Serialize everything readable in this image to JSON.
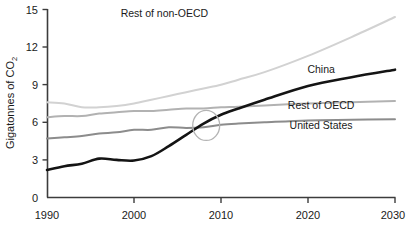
{
  "chart_data": {
    "type": "line",
    "title": "",
    "subtitle": "",
    "xlabel": "",
    "ylabel": "Gigatonnes of CO",
    "ylabel_subscript": "2",
    "xlim": [
      1990,
      2030
    ],
    "ylim": [
      0,
      15
    ],
    "xticks": [
      1990,
      2000,
      2010,
      2020,
      2030
    ],
    "xtick_labels": [
      "1990",
      "2000",
      "2010",
      "2020",
      "2030"
    ],
    "yticks": [
      0,
      3,
      6,
      9,
      12,
      15
    ],
    "ytick_labels": [
      "0",
      "3",
      "6",
      "9",
      "12",
      "15"
    ],
    "grid": false,
    "legend_position": "inline-right",
    "x": [
      1990,
      1992,
      1994,
      1996,
      1998,
      2000,
      2002,
      2004,
      2006,
      2008,
      2010,
      2012,
      2015,
      2020,
      2025,
      2030
    ],
    "series": [
      {
        "name": "Rest of non-OECD",
        "color": "#d2d2d2",
        "label_color": "#1a1a1a",
        "values": [
          7.6,
          7.5,
          7.2,
          7.2,
          7.3,
          7.5,
          7.8,
          8.1,
          8.4,
          8.7,
          9.0,
          9.4,
          10.0,
          11.3,
          12.8,
          14.4
        ],
        "label_x": 2003.5,
        "label_y": 14.4
      },
      {
        "name": "China",
        "color": "#141414",
        "label_color": "#1a1a1a",
        "values": [
          2.2,
          2.5,
          2.7,
          3.1,
          3.0,
          2.95,
          3.3,
          4.1,
          5.0,
          5.9,
          6.6,
          7.1,
          7.8,
          8.9,
          9.6,
          10.2
        ],
        "label_x": 2021.5,
        "label_y": 9.95
      },
      {
        "name": "Rest of OECD",
        "color": "#b2b2b2",
        "label_color": "#1a1a1a",
        "values": [
          6.4,
          6.5,
          6.5,
          6.7,
          6.8,
          6.9,
          6.9,
          7.0,
          7.1,
          7.1,
          7.2,
          7.25,
          7.35,
          7.5,
          7.6,
          7.7
        ],
        "label_x": 2021.5,
        "label_y": 7.1
      },
      {
        "name": "United States",
        "color": "#8c8c8c",
        "label_color": "#1a1a1a",
        "values": [
          4.7,
          4.8,
          4.9,
          5.1,
          5.2,
          5.4,
          5.4,
          5.6,
          5.55,
          5.6,
          5.8,
          5.9,
          6.0,
          6.15,
          6.2,
          6.25
        ],
        "label_x": 2021.5,
        "label_y": 5.45
      }
    ],
    "annotations": [
      {
        "kind": "ellipse",
        "name": "crossover-highlight",
        "center_x": 2008.3,
        "center_y": 5.75,
        "radius_x_years": 1.55,
        "radius_y_units": 1.2,
        "stroke": "#b4b4b4"
      }
    ],
    "axis_color": "#3c3c3c"
  }
}
